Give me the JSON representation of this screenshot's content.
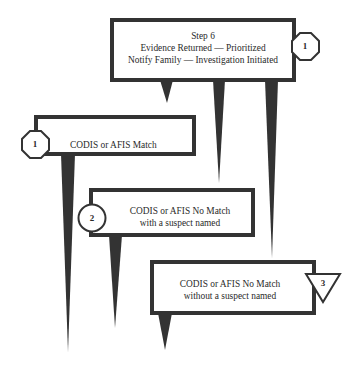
{
  "diagram": {
    "colors": {
      "stroke": "#333333",
      "fill": "#ffffff",
      "text": "#2a2a2a"
    },
    "top_box": {
      "lines": [
        "Step 6",
        "Evidence Returned — Prioritized",
        "Notify Family — Investigation Initiated"
      ],
      "badge": {
        "shape": "octagon",
        "label": "1"
      }
    },
    "branches": [
      {
        "lines": [
          "CODIS or AFIS Match"
        ],
        "badge": {
          "shape": "octagon",
          "label": "1"
        }
      },
      {
        "lines": [
          "CODIS or AFIS No Match",
          "with a suspect named"
        ],
        "badge": {
          "shape": "circle",
          "label": "2"
        }
      },
      {
        "lines": [
          "CODIS or AFIS No Match",
          "without a suspect named"
        ],
        "badge": {
          "shape": "triangle",
          "label": "3"
        }
      }
    ]
  }
}
